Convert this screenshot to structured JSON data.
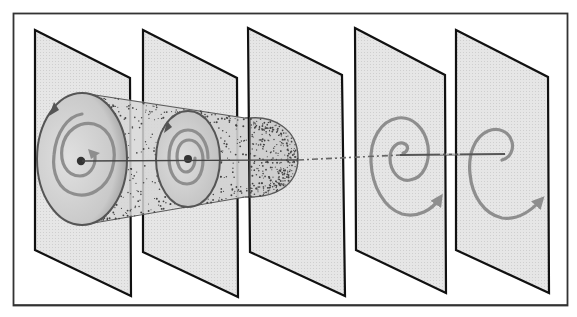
{
  "figure": {
    "plane_count": 5,
    "colors": {
      "background": "#ffffff",
      "frame": "#333333",
      "plane_fill": "#e4e4e4",
      "plane_edge": "#111111",
      "tube_stipple": "#444444",
      "tube_outline": "#555555",
      "spiral": "#8e8e8e",
      "axis": "#444444"
    },
    "planes": [
      {
        "id": "plane-1",
        "content": "large circle section of tube with inward spiral and central fixed point"
      },
      {
        "id": "plane-2",
        "content": "smaller circle section with concentric spiral and central fixed point"
      },
      {
        "id": "plane-3",
        "content": "closed end cap of the tube"
      },
      {
        "id": "plane-4",
        "content": "outward spiral trajectory with arrow"
      },
      {
        "id": "plane-5",
        "content": "open outward spiral trajectory with arrow"
      }
    ]
  }
}
